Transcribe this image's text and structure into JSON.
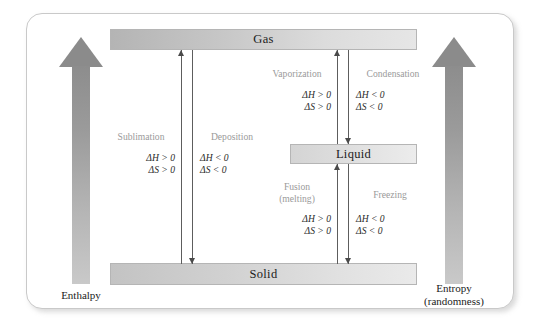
{
  "diagram": {
    "states": {
      "gas": "Gas",
      "liquid": "Liquid",
      "solid": "Solid"
    },
    "axes": {
      "left": {
        "label": "Enthalpy",
        "icon": "up-arrow-icon",
        "direction": "up"
      },
      "right": {
        "label": "Entropy\n(randomness)",
        "icon": "up-arrow-icon",
        "direction": "up"
      }
    },
    "transitions": [
      {
        "key": "sublimation",
        "name": "Sublimation",
        "from": "Solid",
        "to": "Gas",
        "direction": "up",
        "delta_h": "ΔH > 0",
        "delta_s": "ΔS > 0"
      },
      {
        "key": "deposition",
        "name": "Deposition",
        "from": "Gas",
        "to": "Solid",
        "direction": "down",
        "delta_h": "ΔH < 0",
        "delta_s": "ΔS < 0"
      },
      {
        "key": "vaporization",
        "name": "Vaporization",
        "from": "Liquid",
        "to": "Gas",
        "direction": "up",
        "delta_h": "ΔH > 0",
        "delta_s": "ΔS > 0"
      },
      {
        "key": "condensation",
        "name": "Condensation",
        "from": "Gas",
        "to": "Liquid",
        "direction": "down",
        "delta_h": "ΔH < 0",
        "delta_s": "ΔS < 0"
      },
      {
        "key": "fusion",
        "name": "Fusion\n(melting)",
        "from": "Solid",
        "to": "Liquid",
        "direction": "up",
        "delta_h": "ΔH > 0",
        "delta_s": "ΔS > 0"
      },
      {
        "key": "freezing",
        "name": "Freezing",
        "from": "Liquid",
        "to": "Solid",
        "direction": "down",
        "delta_h": "ΔH < 0",
        "delta_s": "ΔS < 0"
      }
    ],
    "colors": {
      "bar_fill_dark": "#b4b4b4",
      "bar_fill_light": "#e6e6e6",
      "bar_border": "#b5b5b5",
      "panel_border": "#c9c9c9",
      "process_text": "#9a9a9a",
      "equation_text": "#2a2a2a",
      "arrow_line": "#5d5d5d",
      "big_arrow_top": "#8b8b8b",
      "big_arrow_bottom": "#c9c9c9",
      "background": "#ffffff"
    }
  }
}
